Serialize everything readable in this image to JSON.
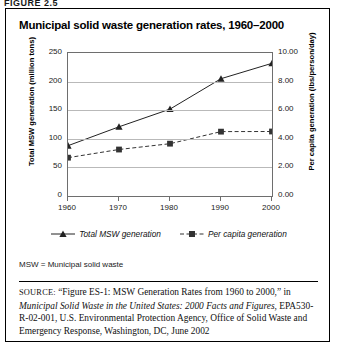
{
  "figure": {
    "number": "FIGURE 2.5",
    "title": "Municipal solid waste generation rates, 1960–2000"
  },
  "abbreviation_note": "MSW = Municipal solid waste",
  "source": {
    "label": "SOURCE:",
    "part1": " “Figure ES-1: MSW Generation Rates from 1960 to 2000,” in ",
    "italic_title": "Municipal Solid Waste in the United States: 2000 Facts and Figures,",
    "part2": " EPA530-R-02-001, U.S. Environmental Protection Agency, Office of Solid Waste and Emergency Response, Washington, DC, June 2002"
  },
  "chart_data": {
    "type": "line",
    "title": "Municipal solid waste generation rates, 1960–2000",
    "xlabel": "",
    "categories": [
      "1960",
      "1970",
      "1980",
      "1990",
      "2000"
    ],
    "x": [
      1960,
      1970,
      1980,
      1990,
      2000
    ],
    "xlim": [
      1960,
      2000
    ],
    "grid": true,
    "legend_position": "bottom",
    "axes": [
      {
        "id": "left",
        "ylabel": "Total MSW generation (million tons)",
        "ylim": [
          0,
          250
        ],
        "yticks": [
          0,
          50,
          100,
          150,
          200,
          250
        ],
        "ytick_labels": [
          "0",
          "50",
          "100",
          "150",
          "200",
          "250"
        ]
      },
      {
        "id": "right",
        "ylabel": "Per capita generation (lbs/person/day)",
        "ylim": [
          0,
          10
        ],
        "yticks": [
          0,
          2,
          4,
          6,
          8,
          10
        ],
        "ytick_labels": [
          "0.00",
          "2.00",
          "4.00",
          "6.00",
          "8.00",
          "10.00"
        ]
      }
    ],
    "series": [
      {
        "name": "Total MSW generation",
        "axis": "left",
        "marker": "triangle",
        "line_style": "solid",
        "color": "#222222",
        "values": [
          88,
          121,
          152,
          205,
          232
        ]
      },
      {
        "name": "Per capita generation",
        "axis": "right",
        "marker": "square",
        "line_style": "dashed",
        "color": "#333333",
        "values": [
          2.68,
          3.25,
          3.66,
          4.5,
          4.51
        ]
      }
    ]
  }
}
